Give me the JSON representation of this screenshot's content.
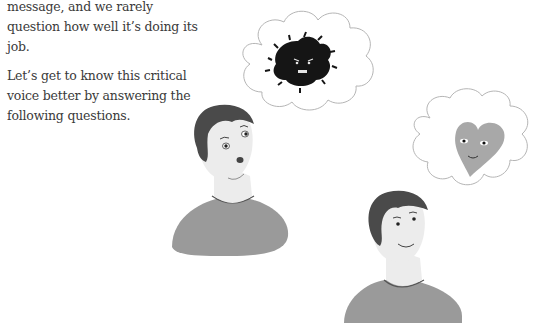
{
  "article": {
    "paragraphs": [
      "message, and we rarely question how well it’s doing its job.",
      "Let’s get to know this critical voice better by answering the following questions."
    ]
  },
  "illustration": {
    "description": "Two illustrated people: a worried man imagining a dark angry scribble creature in a thought cloud, and a calm smiling man imagining a smiling grey heart in a thought cloud",
    "colors": {
      "shirt": "#9a9a9a",
      "hair": "#4a4a4a",
      "skin": "#ececec",
      "cloud_outline": "#b5b5b5",
      "critic": "#151515",
      "heart": "#a8a8a8"
    }
  }
}
